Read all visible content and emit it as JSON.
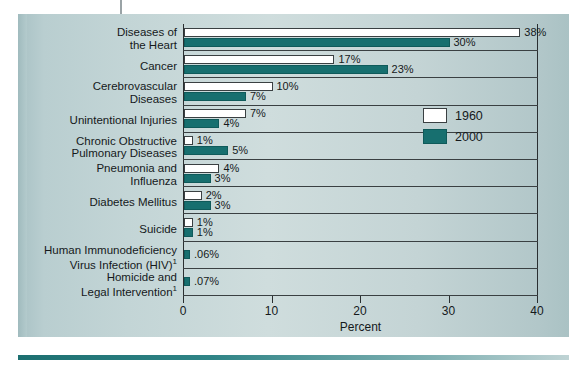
{
  "chart_data": {
    "type": "bar",
    "orientation": "horizontal",
    "title": "",
    "xlabel": "Percent",
    "ylabel": "",
    "xlim": [
      0,
      40
    ],
    "xticks": [
      0,
      10,
      20,
      30,
      40
    ],
    "xtick_labels": [
      "0",
      "10",
      "20",
      "30",
      "40"
    ],
    "grid": false,
    "legend_position": "inside-right",
    "categories": [
      "Diseases of\nthe Heart",
      "Cancer",
      "Cerebrovascular\nDiseases",
      "Unintentional Injuries",
      "Chronic Obstructive\nPulmonary Diseases",
      "Pneumonia and\nInfluenza",
      "Diabetes Mellitus",
      "Suicide",
      "Human Immunodeficiency\nVirus Infection (HIV)",
      "Homicide and\nLegal Intervention"
    ],
    "category_footnotes": [
      "",
      "",
      "",
      "",
      "",
      "",
      "",
      "",
      "1",
      "1"
    ],
    "series": [
      {
        "name": "1960",
        "color": "#ffffff",
        "values": [
          38,
          17,
          10,
          7,
          1,
          4,
          2,
          1,
          null,
          null
        ],
        "labels": [
          "38%",
          "17%",
          "10%",
          "7%",
          "1%",
          "4%",
          "2%",
          "1%",
          "",
          ""
        ]
      },
      {
        "name": "2000",
        "color": "#176f6f",
        "values": [
          30,
          23,
          7,
          4,
          5,
          3,
          3,
          1,
          0.06,
          0.07
        ],
        "labels": [
          "30%",
          "23%",
          "7%",
          "4%",
          "5%",
          "3%",
          "3%",
          "1%",
          ".06%",
          ".07%"
        ]
      }
    ]
  },
  "legend": {
    "items": [
      {
        "label": "1960",
        "swatch": "white-swatch"
      },
      {
        "label": "2000",
        "swatch": "teal-swatch"
      }
    ]
  },
  "axis": {
    "x_title": "Percent",
    "ticks": [
      "0",
      "10",
      "20",
      "30",
      "40"
    ]
  },
  "colors": {
    "series_1960": "#ffffff",
    "series_2000": "#176f6f",
    "panel_background": "#c3d5d6",
    "axis_line": "#2a2f31",
    "text": "#15191b",
    "bottom_rule": "#1c6f70"
  }
}
